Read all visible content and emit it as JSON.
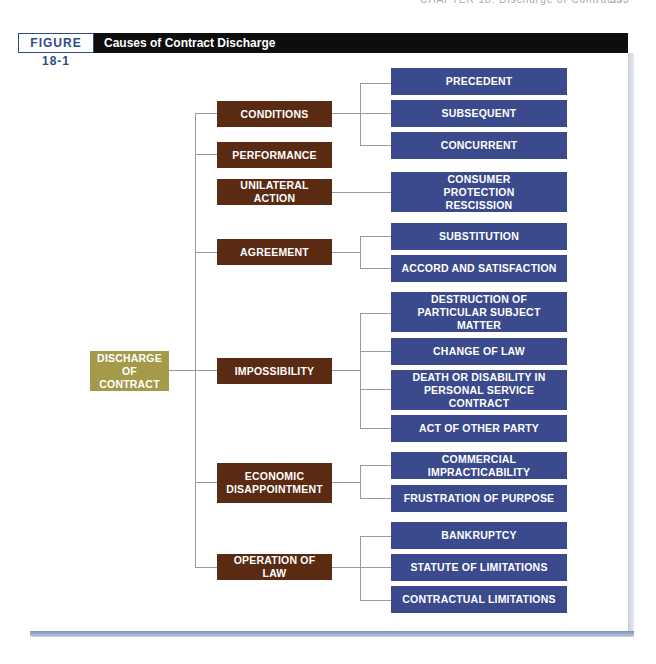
{
  "running_head": {
    "text": "CHAPTER 18: Discharge of Contracts",
    "page": "333"
  },
  "figure": {
    "label": "FIGURE 18-1",
    "title": "Causes of Contract Discharge"
  },
  "colors": {
    "root": "#a39a4a",
    "category": "#5a2a12",
    "leaf": "#3b4a8c",
    "connector": "#9a9a9a",
    "title_bar": "#0d0d0d",
    "label_border": "#2e4a8a"
  },
  "diagram": {
    "root": "DISCHARGE OF CONTRACT",
    "root_lines": [
      "DISCHARGE",
      "OF CONTRACT"
    ],
    "categories": [
      {
        "label": "CONDITIONS",
        "children": [
          "PRECEDENT",
          "SUBSEQUENT",
          "CONCURRENT"
        ]
      },
      {
        "label": "PERFORMANCE",
        "children": []
      },
      {
        "label": "UNILATERAL ACTION",
        "children": [
          "CONSUMER PROTECTION RESCISSION"
        ]
      },
      {
        "label": "AGREEMENT",
        "children": [
          "SUBSTITUTION",
          "ACCORD AND SATISFACTION"
        ]
      },
      {
        "label": "IMPOSSIBILITY",
        "children": [
          "DESTRUCTION OF PARTICULAR SUBJECT MATTER",
          "CHANGE OF LAW",
          "DEATH OR DISABILITY IN PERSONAL SERVICE CONTRACT",
          "ACT OF OTHER PARTY"
        ]
      },
      {
        "label": "ECONOMIC DISAPPOINTMENT",
        "children": [
          "COMMERCIAL IMPRACTICABILITY",
          "FRUSTRATION OF PURPOSE"
        ]
      },
      {
        "label": "OPERATION OF LAW",
        "children": [
          "BANKRUPTCY",
          "STATUTE OF LIMITATIONS",
          "CONTRACTUAL LIMITATIONS"
        ]
      }
    ]
  }
}
